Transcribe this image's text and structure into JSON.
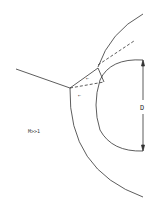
{
  "diagram": {
    "type": "blunt-body-shock",
    "colors": {
      "stroke": "#333333",
      "background": "#ffffff"
    },
    "labels": {
      "mach": "M>>1",
      "diameter": "D",
      "flow_mark_1": "←",
      "flow_mark_2": "←"
    }
  }
}
